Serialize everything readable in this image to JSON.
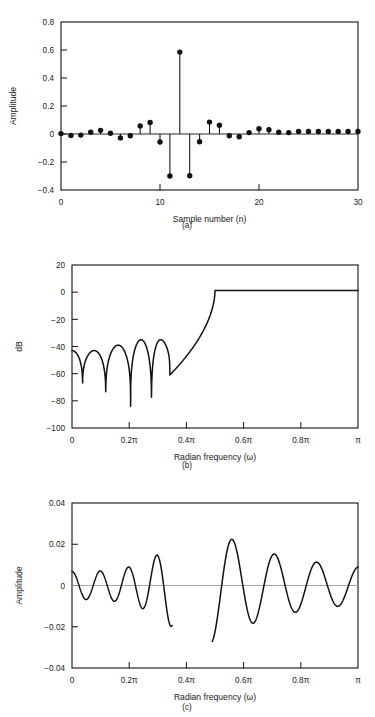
{
  "figure": {
    "kind": "dsp-filter-figure",
    "panel_a_caption": "(a)",
    "panel_b_caption": "(b)",
    "panel_c_caption": "(c)"
  },
  "chart_data": [
    {
      "type": "bar",
      "subtype": "stem",
      "panel": "a",
      "title": "",
      "caption": "(a)",
      "xlabel": "Sample number (n)",
      "ylabel": "Amplitude",
      "xlim": [
        0,
        30
      ],
      "ylim": [
        -0.4,
        0.8
      ],
      "xticks": [
        0,
        10,
        20,
        30
      ],
      "xticklabels": [
        "0",
        "10",
        "20",
        "30"
      ],
      "yticks": [
        -0.4,
        -0.2,
        0,
        0.2,
        0.4,
        0.6,
        0.8
      ],
      "yticklabels": [
        "-0.4",
        "-0.2",
        "0",
        "0.2",
        "0.4",
        "0.6",
        "0.8"
      ],
      "grid": false,
      "legend": "none",
      "marker": "filled-circle",
      "categories": [
        0,
        1,
        2,
        3,
        4,
        5,
        6,
        7,
        8,
        9,
        10,
        11,
        12,
        13,
        14,
        15,
        16,
        17,
        18,
        19,
        20,
        21,
        22,
        23,
        24,
        25,
        26,
        27,
        28,
        29,
        30
      ],
      "values": [
        0.003,
        -0.01,
        -0.008,
        0.012,
        0.026,
        0.005,
        -0.028,
        -0.013,
        0.058,
        0.082,
        -0.057,
        -0.3,
        0.585,
        -0.298,
        -0.055,
        0.085,
        0.062,
        -0.012,
        -0.02,
        0.01,
        0.038,
        0.03,
        0.012,
        0.01,
        0.018,
        0.018,
        0.018,
        0.018,
        0.018,
        0.018,
        0.018
      ]
    },
    {
      "type": "line",
      "panel": "b",
      "title": "",
      "caption": "(b)",
      "xlabel": "Radian frequency (ω)",
      "ylabel": "dB",
      "xlim": [
        0,
        1
      ],
      "ylim": [
        -100,
        20
      ],
      "xticks": [
        0,
        0.2,
        0.4,
        0.6,
        0.8,
        1
      ],
      "xticklabels": [
        "0",
        "0.2π",
        "0.4π",
        "0.6π",
        "0.8π",
        "π"
      ],
      "yticks": [
        -100,
        -80,
        -60,
        -40,
        -20,
        0,
        20
      ],
      "yticklabels": [
        "-100",
        "-80",
        "-60",
        "-40",
        "-20",
        "0",
        "20"
      ],
      "grid": false,
      "legend": "none",
      "description": "Log magnitude of a highpass FIR filter. Stopband lobes near -40 dB with deep nulls, transition near 0.35π-0.5π, passband at about 1 dB.",
      "stopband_peaks_db": [
        -43,
        -43,
        -39,
        -35
      ],
      "null_positions_pi": [
        0.037,
        0.118,
        0.205,
        0.278,
        0.342
      ],
      "null_depths_db": [
        -72,
        -80,
        -84,
        -87,
        -61
      ],
      "passband_level_db": 1.2,
      "cutoff_pi": 0.42
    },
    {
      "type": "line",
      "panel": "c",
      "title": "",
      "caption": "(c)",
      "xlabel": "Radian frequency (ω)",
      "ylabel": "Amplitude",
      "xlim": [
        0,
        1
      ],
      "ylim": [
        -0.04,
        0.04
      ],
      "xticks": [
        0,
        0.2,
        0.4,
        0.6,
        0.8,
        1
      ],
      "xticklabels": [
        "0",
        "0.2π",
        "0.4π",
        "0.6π",
        "0.8π",
        "π"
      ],
      "yticks": [
        -0.04,
        -0.02,
        0,
        0.02,
        0.04
      ],
      "yticklabels": [
        "-0.04",
        "-0.02",
        "0",
        "0.02",
        "0.04"
      ],
      "grid": false,
      "legend": "none",
      "zero_reference_line": true,
      "description": "Approximation error ripple; curve is broken across the transition band between about 0.35π and 0.49π.",
      "gap_range_pi": [
        0.35,
        0.49
      ],
      "ripple_amplitude": 0.02
    }
  ]
}
